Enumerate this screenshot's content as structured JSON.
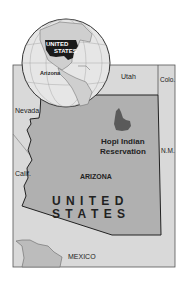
{
  "map": {
    "colors": {
      "background": "#ffffff",
      "surrounding_land": "#d9d9d9",
      "arizona_fill": "#b0b0b0",
      "reservation_fill": "#5a5a5a",
      "border": "#222222",
      "globe_ocean": "#e6e6e6",
      "globe_us": "#1a1a1a"
    },
    "globe": {
      "us_label_line1": "UNITED",
      "us_label_line2": "STATES",
      "arizona_label": "Arizona"
    },
    "neighbors": {
      "utah": "Utah",
      "colorado": "Colo.",
      "nevada": "Nevada",
      "california": "Calif.",
      "new_mexico": "N.M.",
      "mexico": "MEXICO"
    },
    "state_label": "ARIZONA",
    "country_line1": "U N I T E D",
    "country_line2": "S T A T E S",
    "reservation": {
      "line1": "Hopi Indian",
      "line2": "Reservation"
    }
  }
}
